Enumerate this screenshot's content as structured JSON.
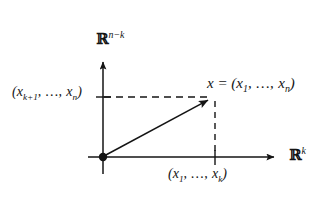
{
  "figure": {
    "kind": "math-diagram",
    "background_color": "#ffffff",
    "ink_color": "#141414"
  },
  "axes": {
    "vertical": {
      "label_base": "ℝ",
      "label_exponent": "n−k",
      "origin": {
        "x": 103,
        "y": 157
      },
      "tip": {
        "x": 103,
        "y": 58
      }
    },
    "horizontal": {
      "label_base": "ℝ",
      "label_exponent": "k",
      "origin": {
        "x": 103,
        "y": 157
      },
      "tip": {
        "x": 280,
        "y": 157
      }
    }
  },
  "point": {
    "name_label": "x",
    "equals_sign": "=",
    "coords_open": "(",
    "coords_first": "x",
    "coords_first_sub": "1",
    "coords_ellipsis": ", …, ",
    "coords_last": "x",
    "coords_last_sub": "n",
    "coords_close": ")",
    "position": {
      "x": 215,
      "y": 97
    }
  },
  "projections": {
    "vertical_axis_label": {
      "open": "(",
      "first": "x",
      "first_sub": "k+1",
      "ellipsis": ", …, ",
      "last": "x",
      "last_sub": "n",
      "close": ")",
      "tick": {
        "x": 103,
        "y": 97
      }
    },
    "horizontal_axis_label": {
      "open": "(",
      "first": "x",
      "first_sub": "1",
      "ellipsis": ", …, ",
      "last": "x",
      "last_sub": "k",
      "close": ")",
      "tick": {
        "x": 215,
        "y": 157
      }
    }
  },
  "vector": {
    "from": {
      "x": 103,
      "y": 157
    },
    "to": {
      "x": 215,
      "y": 97
    },
    "style": "solid-arrow"
  },
  "dashed_lines": [
    {
      "name": "horizontal-projection",
      "from": {
        "x": 103,
        "y": 97
      },
      "to": {
        "x": 213,
        "y": 97
      }
    },
    {
      "name": "vertical-projection",
      "from": {
        "x": 215,
        "y": 101
      },
      "to": {
        "x": 215,
        "y": 157
      }
    }
  ]
}
